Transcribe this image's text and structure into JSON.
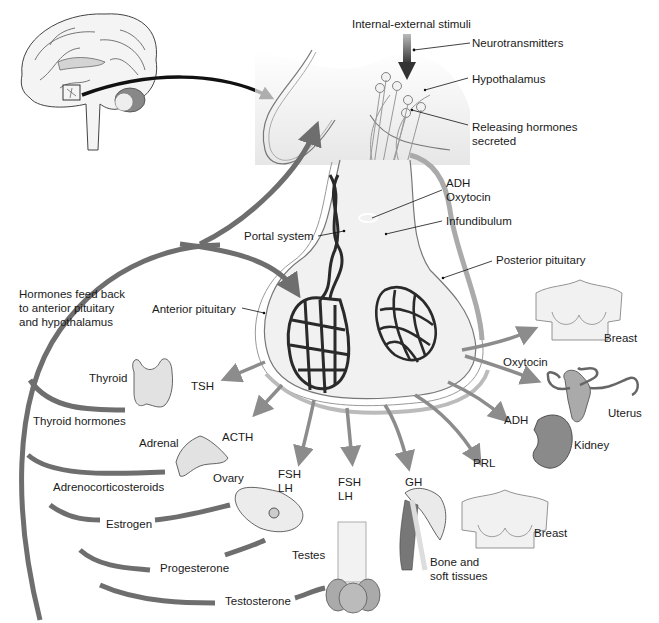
{
  "colors": {
    "background": "#ffffff",
    "feedback_arrow": "#6e6e6e",
    "hormone_arrow": "#8c8c8c",
    "capillary": "#2a2a2a",
    "organ_fill": "#e2e2e2",
    "pituitary_fill": "#eeeeee",
    "label_text": "#1a1a1a"
  },
  "labels": {
    "stimuli": "Internal-external stimuli",
    "neurotransmitters": "Neurotransmitters",
    "hypothalamus": "Hypothalamus",
    "releasing_hormones": "Releasing hormones\nsecreted",
    "adh_oxytocin": "ADH\nOxytocin",
    "infundibulum": "Infundibulum",
    "portal_system": "Portal system",
    "posterior_pituitary": "Posterior pituitary",
    "anterior_pituitary": "Anterior pituitary",
    "feedback": "Hormones feed back\nto anterior pituitary\nand hypothalamus"
  },
  "anterior_targets": [
    {
      "organ": "Thyroid",
      "hormone": "TSH",
      "feedback": "Thyroid hormones"
    },
    {
      "organ": "Adrenal",
      "hormone": "ACTH",
      "feedback": "Adrenocorticosteroids"
    },
    {
      "organ": "Ovary",
      "hormone": "FSH\nLH",
      "feedback": "Estrogen"
    },
    {
      "organ": "Ovary",
      "hormone": "FSH\nLH",
      "feedback": "Progesterone"
    },
    {
      "organ": "Testes",
      "hormone": "FSH\nLH",
      "feedback": "Testosterone"
    },
    {
      "organ": "Bone and\nsoft tissues",
      "hormone": "GH"
    },
    {
      "organ": "Breast",
      "hormone": "PRL"
    }
  ],
  "posterior_targets": [
    {
      "organ": "Breast",
      "hormone": "Oxytocin"
    },
    {
      "organ": "Uterus",
      "hormone": "Oxytocin"
    },
    {
      "organ": "Kidney",
      "hormone": "ADH"
    }
  ],
  "organ_labels": {
    "thyroid": "Thyroid",
    "adrenal": "Adrenal",
    "ovary": "Ovary",
    "testes": "Testes",
    "bone": "Bone and\nsoft tissues",
    "breast_prl": "Breast",
    "breast_oxy": "Breast",
    "uterus": "Uterus",
    "kidney": "Kidney"
  },
  "hormone_labels": {
    "tsh": "TSH",
    "acth": "ACTH",
    "fsh_lh_1": "FSH\nLH",
    "fsh_lh_2": "FSH\nLH",
    "gh": "GH",
    "prl": "PRL",
    "oxytocin": "Oxytocin",
    "adh": "ADH"
  },
  "feedback_labels": {
    "thyroid_hormones": "Thyroid hormones",
    "adrenocorticosteroids": "Adrenocorticosteroids",
    "estrogen": "Estrogen",
    "progesterone": "Progesterone",
    "testosterone": "Testosterone"
  }
}
